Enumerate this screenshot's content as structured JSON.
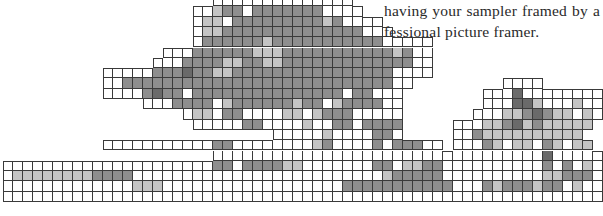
{
  "page": {
    "text_lines": [
      "having your sampler framed by a",
      "fessional picture framer."
    ]
  },
  "chart": {
    "cell_width": 10,
    "cell_height": 10.3,
    "shades": {
      "w": "#ffffff",
      "l": "#c4c4c4",
      "m": "#8e8e8e",
      "d": "#6a6a6a"
    },
    "legend": {
      ".": "empty",
      "w": "unstitched square",
      "l": "light shade stitch",
      "m": "medium shade stitch",
      "d": "dark shade stitch"
    },
    "rows": [
      ".....................wwwwwwwwwwwwww.........................",
      "...................wwlmmwmmmmmmmwwww........................",
      "...................wllwmmmmmmmmmlmwwww......................",
      "...................wllmmmmmmmmmmmmmmwww.....................",
      "...................wmmmmmmlmmmmmmmmmmmwwwww.................",
      "................wwwmmmmmmlllmmmmmmmmmmmlmww.................",
      "...............wwwmmmmllmmllmmmmmmmmmmmmmww.................",
      "..........wwwwwmmmdmmllmmmmmmmmmmmmmmmmwwww.................",
      "..........wwmmmmmmmmmmmmmmmmmmmmmmmmmmmww.........wwww......",
      "..........wwwwmdmmwmmmmmmmmmmmmmmmwmmwww........wwwdwwwwwwww",
      "..............wwwmmmmwlmmmmmmlmmwlmmmmww........wwwddlwwwlww",
      "..................wllwmmwwwwllwlmmmwwwww.......wwwllmdmllwlw",
      "...................wwwwwmmwwwwlwwmmwmmmm.....wwwllmdlmlllll.",
      "...........................wwwwwlwwwwmmw.....wwmllllllllll..",
      "..........wwwwwwwwwwwmmwwwwwwwwlmwwwwmwmmmww.wwwmlwllwmlwll..",
      ".....................wwwwwwwwwwwwwwwwwwwwwwwwwwwwwwwwwdwwwww",
      "wwwwwwwwwwwwwwwwwwwwwmmwmmmmllwwwwwwwmmwllmmwwwwwwwwwwmwmwlw",
      "wllllllllmmmmwwwwwwwwwwwwwwwwwwwwwwwwwlmmmmmwwwwwwwwwwllmmmw",
      "wwwwwwwwwwwwwlllwwwwwwwwwwwwwwwwwwmmmmmmmmmmmwwwmlmmmlmmwlww",
      "wwwwwwwwwwwwwwwwwwwwwwwwwwwwwwwwwwwwwwwwwwwwwwwwwwwwwwwwwwww"
    ]
  }
}
